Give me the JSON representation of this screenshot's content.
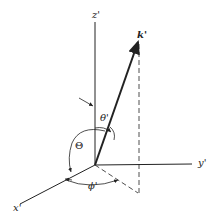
{
  "diagram": {
    "axes": {
      "z": "z'",
      "y": "y'",
      "x": "x'"
    },
    "vector": {
      "label": "k'"
    },
    "angles": {
      "polar": "θ'",
      "azimuthal": "ϕ'",
      "big": "Θ"
    },
    "colors": {
      "ink": "#222222",
      "background": "#ffffff"
    }
  }
}
